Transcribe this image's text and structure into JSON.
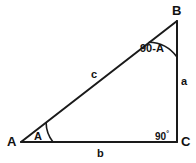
{
  "figure": {
    "kind": "right-triangle-diagram",
    "background_color": "#ffffff",
    "stroke_color": "#1a1a1a",
    "vertices": {
      "A": {
        "label": "A",
        "x": 21,
        "y": 142
      },
      "B": {
        "label": "B",
        "x": 177,
        "y": 21
      },
      "C": {
        "label": "C",
        "x": 177,
        "y": 142
      }
    },
    "sides": {
      "hypotenuse": {
        "label": "c",
        "from": "A",
        "to": "B"
      },
      "vertical": {
        "label": "a",
        "from": "B",
        "to": "C"
      },
      "base": {
        "label": "b",
        "from": "A",
        "to": "C"
      }
    },
    "angles": {
      "at_A": {
        "label": "A",
        "arc": true
      },
      "at_B": {
        "label": "90-A",
        "arc": true
      },
      "at_C": {
        "label": "90",
        "degree_symbol": "°",
        "arc": false
      }
    }
  }
}
